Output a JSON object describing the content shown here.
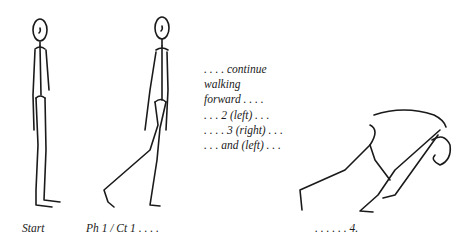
{
  "figures": [
    {
      "id": "start",
      "caption": "Start"
    },
    {
      "id": "phase1",
      "caption": "Ph 1 / Ct 1 . . . ."
    },
    {
      "id": "count4",
      "caption": ". . . . . . 4."
    }
  ],
  "notes": {
    "lines": [
      ". . . . continue",
      "walking",
      "forward . . . .",
      ". . . 2 (left) . . .",
      ". . . . 3 (right) . . .",
      ". . . and (left) . . ."
    ]
  }
}
